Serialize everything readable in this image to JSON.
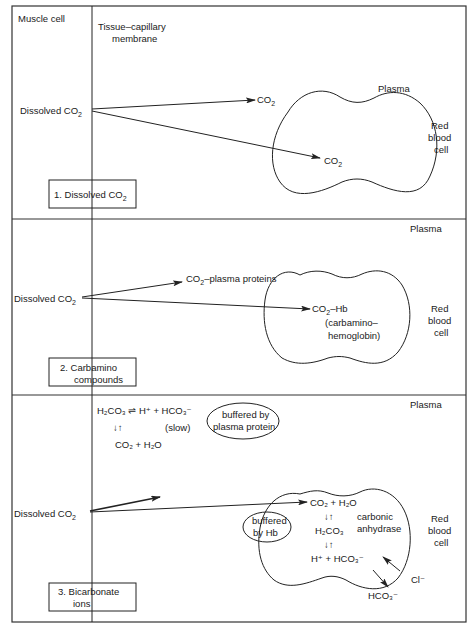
{
  "labels": {
    "muscle_cell": "Muscle cell",
    "membrane_line1": "Tissue–capillary",
    "membrane_line2": "membrane",
    "plasma": "Plasma",
    "rbc_line1": "Red",
    "rbc_line2": "blood",
    "rbc_line3": "cell"
  },
  "panels": [
    {
      "title_line1": "1.  Dissolved CO",
      "title_sub": "2",
      "source": "Dissolved CO",
      "source_sub": "2",
      "targets": [
        {
          "text": "CO",
          "sub": "2",
          "location": "plasma"
        },
        {
          "text": "CO",
          "sub": "2",
          "location": "red blood cell"
        }
      ]
    },
    {
      "title_line1": "2.  Carbamino",
      "title_line2": "compounds",
      "source": "Dissolved CO",
      "source_sub": "2",
      "plasma_product_pre": "CO",
      "plasma_product_sub": "2",
      "plasma_product_post": "–plasma proteins",
      "rbc_product_pre": "CO",
      "rbc_product_sub": "2",
      "rbc_product_post": "–Hb",
      "rbc_note_line1": "(carbamino–",
      "rbc_note_line2": "hemoglobin)"
    },
    {
      "title_line1": "3.  Bicarbonate",
      "title_line2": "ions",
      "source": "Dissolved CO",
      "source_sub": "2",
      "plasma_eq_line1": "H₂CO₃ ⇌ H⁺ + HCO₃⁻",
      "plasma_eq_arrows": "↓↑",
      "plasma_eq_rate": "(slow)",
      "plasma_eq_line3": "CO₂ + H₂O",
      "plasma_buffer_line1": "buffered by",
      "plasma_buffer_line2": "plasma protein",
      "rbc_eq_line1": "CO₂ + H₂O",
      "rbc_eq_arrows1": "↓↑",
      "rbc_eq_line2": "H₂CO₃",
      "rbc_eq_arrows2": "↓↑",
      "rbc_eq_line3": "H⁺ + HCO₃⁻",
      "enzyme_line1": "carbonic",
      "enzyme_line2": "anhydrase",
      "rbc_buffer_line1": "buffered",
      "rbc_buffer_line2": "by Hb",
      "chloride": "Cl⁻",
      "bicarbonate_out": "HCO₃⁻"
    }
  ]
}
